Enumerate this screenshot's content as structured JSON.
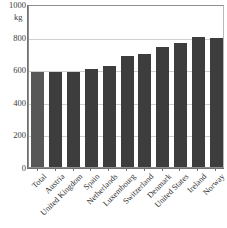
{
  "chart_data": {
    "type": "bar",
    "title": "",
    "subtitle": "",
    "xlabel": "",
    "ylabel": "",
    "unit_label": "kg",
    "ylim": [
      0,
      1000
    ],
    "yticks": [
      1000,
      800,
      600,
      400,
      200,
      0
    ],
    "ytick_labels": [
      "1000",
      "800",
      "600",
      "400",
      "200",
      "0"
    ],
    "gridlines": [
      800,
      600,
      400,
      200
    ],
    "grid": true,
    "legend": null,
    "categories": [
      "Total",
      "Austria",
      "United Kingdom",
      "Spain",
      "Netherlands",
      "Luxembourg",
      "Switzerland",
      "Denmark",
      "United States",
      "Ireland",
      "Norway"
    ],
    "values": [
      583,
      583,
      583,
      600,
      620,
      680,
      695,
      735,
      758,
      795,
      793
    ],
    "bar_colors": [
      "#575757",
      "#3d3d3d",
      "#3d3d3d",
      "#3d3d3d",
      "#3d3d3d",
      "#3d3d3d",
      "#3d3d3d",
      "#3d3d3d",
      "#3d3d3d",
      "#3d3d3d",
      "#3d3d3d"
    ],
    "highlight_index": 0,
    "accent_color": "#3d3d3d",
    "highlight_color": "#575757",
    "grid_color": "#cfcfcf",
    "axis_color": "#6f6f6f"
  }
}
